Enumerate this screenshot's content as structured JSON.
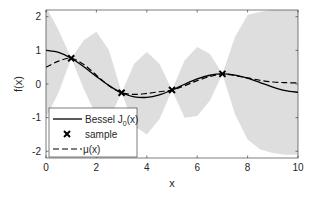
{
  "chart_data": {
    "type": "line",
    "title": "",
    "xlabel": "x",
    "ylabel": "f(x)",
    "xlim": [
      0,
      10
    ],
    "ylim": [
      -2.2,
      2.2
    ],
    "xticks": [
      0,
      2,
      4,
      6,
      8,
      10
    ],
    "xtick_labels": [
      "0",
      "2",
      "4",
      "6",
      "8",
      "10"
    ],
    "yticks": [
      -2,
      -1,
      0,
      1,
      2
    ],
    "ytick_labels": [
      "-2",
      "-1",
      "0",
      "1",
      "2"
    ],
    "grid": false,
    "legend_position": "lower left",
    "series": [
      {
        "name": "Bessel J0(x)",
        "legend_label": "Bessel J",
        "legend_sub": "0",
        "legend_suffix": "(x)",
        "style": "solid",
        "color": "#000000",
        "x": [
          0,
          0.5,
          1,
          1.5,
          2,
          2.5,
          3,
          3.5,
          4,
          4.5,
          5,
          5.5,
          6,
          6.5,
          7,
          7.5,
          8,
          8.5,
          9,
          9.5,
          10
        ],
        "y": [
          1.0,
          0.938,
          0.765,
          0.512,
          0.224,
          -0.048,
          -0.26,
          -0.38,
          -0.397,
          -0.321,
          -0.178,
          -0.007,
          0.151,
          0.26,
          0.3,
          0.266,
          0.172,
          0.042,
          -0.09,
          -0.194,
          -0.246
        ]
      },
      {
        "name": "sample",
        "legend_label": "sample",
        "style": "marker-x",
        "color": "#000000",
        "x": [
          1,
          3,
          5,
          7
        ],
        "y": [
          0.765,
          -0.26,
          -0.178,
          0.3
        ]
      },
      {
        "name": "mu(x)",
        "legend_label": "μ(x)",
        "style": "dashed",
        "color": "#000000",
        "x": [
          0,
          0.5,
          1,
          1.5,
          2,
          2.5,
          3,
          3.5,
          4,
          4.5,
          5,
          5.5,
          6,
          6.5,
          7,
          7.5,
          8,
          8.5,
          9,
          9.5,
          10
        ],
        "y": [
          0.5,
          0.68,
          0.765,
          0.58,
          0.26,
          -0.05,
          -0.26,
          -0.31,
          -0.28,
          -0.23,
          -0.178,
          -0.05,
          0.1,
          0.22,
          0.3,
          0.25,
          0.18,
          0.11,
          0.06,
          0.04,
          0.03
        ]
      }
    ],
    "confidence_band": {
      "name": "uncertainty",
      "color": "#dedede",
      "x": [
        0,
        0.5,
        1,
        1.5,
        2,
        2.5,
        3,
        3.5,
        4,
        4.5,
        5,
        5.5,
        6,
        6.5,
        7,
        7.5,
        8,
        8.5,
        9,
        9.5,
        10
      ],
      "upper": [
        2.3,
        1.6,
        0.765,
        1.3,
        1.55,
        1.0,
        -0.26,
        0.6,
        0.95,
        0.6,
        -0.178,
        0.7,
        1.1,
        0.9,
        0.3,
        1.4,
        2.05,
        2.15,
        2.2,
        2.2,
        2.2
      ],
      "lower": [
        -1.0,
        -0.25,
        0.765,
        -0.15,
        -0.95,
        -1.05,
        -0.26,
        -1.25,
        -1.5,
        -1.05,
        -0.178,
        -1.0,
        -0.95,
        -0.5,
        0.3,
        -0.9,
        -1.65,
        -1.95,
        -2.05,
        -2.1,
        -2.1
      ]
    }
  }
}
